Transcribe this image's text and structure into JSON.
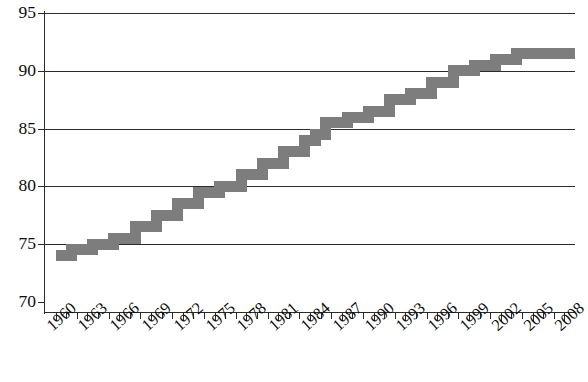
{
  "chart_data": {
    "type": "line",
    "title": "",
    "subtitle": "",
    "xlabel": "",
    "ylabel": "",
    "xlim": [
      1959.0,
      2009.0
    ],
    "ylim": [
      70,
      95
    ],
    "grid": true,
    "legend": null,
    "style": {
      "line_color": "#7d7d7d",
      "line_width_px": 11,
      "axis_color": "#2b2b2b",
      "background": "#ffffff",
      "drawing": "thick-gray-stepped-line"
    },
    "y_ticks": [
      70,
      75,
      80,
      85,
      90,
      95
    ],
    "y_tick_labels": [
      "70",
      "75",
      "80",
      "85",
      "90",
      "95"
    ],
    "x_tick_labels": [
      "1960",
      "1963",
      "1966",
      "1969",
      "1972",
      "1975",
      "1978",
      "1981",
      "1984",
      "1987",
      "1990",
      "1993",
      "1996",
      "1999",
      "2002",
      "2005",
      "2008"
    ],
    "x_tick_label_years": [
      1960,
      1963,
      1966,
      1969,
      1972,
      1975,
      1978,
      1981,
      1984,
      1987,
      1990,
      1993,
      1996,
      1999,
      2002,
      2005,
      2008
    ],
    "x_minor_tick_years": [
      1960,
      1961,
      1962,
      1963,
      1964,
      1965,
      1966,
      1967,
      1968,
      1969,
      1970,
      1971,
      1972,
      1973,
      1974,
      1975,
      1976,
      1977,
      1978,
      1979,
      1980,
      1981,
      1982,
      1983,
      1984,
      1985,
      1986,
      1987,
      1988,
      1989,
      1990,
      1991,
      1992,
      1993,
      1994,
      1995,
      1996,
      1997,
      1998,
      1999,
      2000,
      2001,
      2002,
      2003,
      2004,
      2005,
      2006,
      2007,
      2008
    ],
    "x": [
      1960,
      1961,
      1962,
      1963,
      1964,
      1965,
      1966,
      1967,
      1968,
      1969,
      1970,
      1971,
      1972,
      1973,
      1974,
      1975,
      1976,
      1977,
      1978,
      1979,
      1980,
      1981,
      1982,
      1983,
      1984,
      1985,
      1986,
      1987,
      1988,
      1989,
      1990,
      1991,
      1992,
      1993,
      1994,
      1995,
      1996,
      1997,
      1998,
      1999,
      2000,
      2001,
      2002,
      2003,
      2004,
      2005,
      2006,
      2007,
      2008
    ],
    "values": [
      74.0,
      74.0,
      74.5,
      74.5,
      75.0,
      75.0,
      75.5,
      75.5,
      76.5,
      76.5,
      77.5,
      77.5,
      78.5,
      78.5,
      79.5,
      79.5,
      80.0,
      80.0,
      81.0,
      81.0,
      82.0,
      82.0,
      83.0,
      83.0,
      84.0,
      84.5,
      85.5,
      85.5,
      86.0,
      86.0,
      86.5,
      86.5,
      87.5,
      87.5,
      88.0,
      88.0,
      89.0,
      89.0,
      90.0,
      90.0,
      90.5,
      90.5,
      91.0,
      91.0,
      91.5,
      91.5,
      91.5,
      91.5,
      91.5
    ],
    "series": [
      {
        "name": "series-1",
        "values": [
          74.0,
          74.0,
          74.5,
          74.5,
          75.0,
          75.0,
          75.5,
          75.5,
          76.5,
          76.5,
          77.5,
          77.5,
          78.5,
          78.5,
          79.5,
          79.5,
          80.0,
          80.0,
          81.0,
          81.0,
          82.0,
          82.0,
          83.0,
          83.0,
          84.0,
          84.5,
          85.5,
          85.5,
          86.0,
          86.0,
          86.5,
          86.5,
          87.5,
          87.5,
          88.0,
          88.0,
          89.0,
          89.0,
          90.0,
          90.0,
          90.5,
          90.5,
          91.0,
          91.0,
          91.5,
          91.5,
          91.5,
          91.5,
          91.5
        ]
      }
    ]
  }
}
